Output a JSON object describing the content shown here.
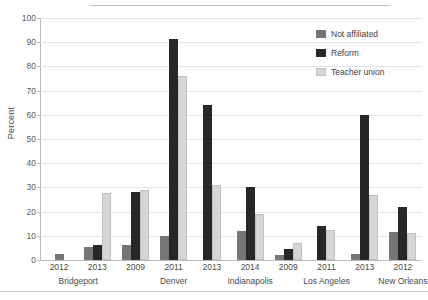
{
  "chart_data": {
    "type": "bar",
    "title": "",
    "subtitle": "",
    "xlabel": "",
    "ylabel": "Percent",
    "ylim": [
      0,
      100
    ],
    "ytick_step": 10,
    "yticks": [
      0,
      10,
      20,
      30,
      40,
      50,
      60,
      70,
      80,
      90,
      100
    ],
    "ytick_labels": [
      "0",
      "10",
      "20",
      "30",
      "40",
      "50",
      "60",
      "70",
      "80",
      "90",
      "100"
    ],
    "grid": true,
    "grid_axis": "y",
    "legend_position": "top-right",
    "orientation": "vertical",
    "categories": [
      "Bridgeport 2012",
      "Bridgeport 2013",
      "Denver 2009",
      "Denver 2011",
      "Denver 2013",
      "Indianapolis 2014",
      "Los Angeles 2009",
      "Los Angeles 2011",
      "Los Angeles 2013",
      "New Orleans 2012"
    ],
    "years": [
      "2012",
      "2013",
      "2009",
      "2011",
      "2013",
      "2014",
      "2009",
      "2011",
      "2013",
      "2012"
    ],
    "city_groups": [
      {
        "city": "Bridgeport",
        "years": [
          "2012",
          "2013"
        ]
      },
      {
        "city": "Denver",
        "years": [
          "2009",
          "2011",
          "2013"
        ]
      },
      {
        "city": "Indianapolis",
        "years": [
          "2014"
        ]
      },
      {
        "city": "Los Angeles",
        "years": [
          "2009",
          "2011",
          "2013"
        ]
      },
      {
        "city": "New Orleans",
        "years": [
          "2012"
        ]
      }
    ],
    "series": [
      {
        "name": "Not affiliated",
        "color": "#767676",
        "values": [
          2.5,
          5.5,
          6,
          10,
          0,
          12,
          2,
          0,
          2.5,
          11.5
        ]
      },
      {
        "name": "Reform",
        "color": "#272727",
        "values": [
          0,
          6,
          28,
          91.5,
          64,
          30,
          4.5,
          14,
          60,
          22
        ]
      },
      {
        "name": "Teacher union",
        "color": "#d6d6d6",
        "values": [
          0,
          27.5,
          29,
          76,
          31,
          19,
          7,
          12.5,
          27,
          11
        ]
      }
    ]
  },
  "legend": {
    "items": [
      {
        "label": "Not affiliated",
        "color": "#767676"
      },
      {
        "label": "Reform",
        "color": "#272727"
      },
      {
        "label": "Teacher union",
        "color": "#d6d6d6"
      }
    ]
  }
}
